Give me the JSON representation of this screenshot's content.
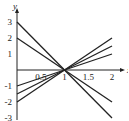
{
  "chart_data": {
    "type": "line",
    "title": "",
    "xlabel": "x",
    "ylabel": "y",
    "xlim": [
      0,
      2
    ],
    "ylim": [
      -3,
      3
    ],
    "grid": false,
    "x_ticks": [
      {
        "value": 0.5,
        "label": "0.5"
      },
      {
        "value": 1,
        "label": "1"
      },
      {
        "value": 1.5,
        "label": "1.5"
      },
      {
        "value": 2,
        "label": "2"
      }
    ],
    "y_ticks": [
      {
        "value": 3,
        "label": "3"
      },
      {
        "value": 2,
        "label": "2"
      },
      {
        "value": 1,
        "label": "1"
      },
      {
        "value": -1,
        "label": "-1"
      },
      {
        "value": -2,
        "label": "-2"
      },
      {
        "value": -3,
        "label": "-3"
      }
    ],
    "x": [
      0,
      2
    ],
    "series": [
      {
        "name": "y = 3 - 3x",
        "values": [
          3,
          -3
        ]
      },
      {
        "name": "y = 2 - 2x",
        "values": [
          2,
          -2
        ]
      },
      {
        "name": "y = x - 1",
        "values": [
          -1,
          1
        ]
      },
      {
        "name": "y = 1.5x - 1.5",
        "values": [
          -1.5,
          1.5
        ]
      },
      {
        "name": "y = 2x - 2",
        "values": [
          -2,
          2
        ]
      }
    ],
    "line_color": "#222222"
  }
}
